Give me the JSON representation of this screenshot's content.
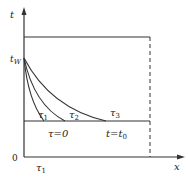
{
  "diagram": {
    "axes": {
      "y_label": "t",
      "x_label": "x",
      "origin_label": "0",
      "x_tick_label": "τ1"
    },
    "levels": {
      "wall_label": "tW",
      "initial_region_label": "τ=0",
      "final_region_label": "t=t0"
    },
    "curves": [
      {
        "label": "τ1",
        "start": [
          24,
          58
        ],
        "end": [
          44,
          121
        ]
      },
      {
        "label": "τ2",
        "start": [
          24,
          58
        ],
        "end": [
          65,
          121
        ]
      },
      {
        "label": "τ3",
        "start": [
          24,
          58
        ],
        "end": [
          106,
          121
        ]
      }
    ],
    "colors": {
      "line": "#333333",
      "background": "#ffffff"
    }
  }
}
